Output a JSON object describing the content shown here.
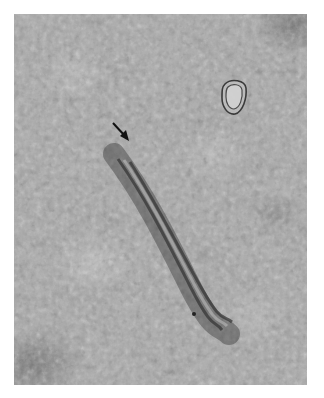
{
  "image": {
    "type": "transmission electron micrograph",
    "description": "Grayscale electron micrograph with a granular background, an elongated double-lined fibrous structure running diagonally from upper-left to lower-right, a small membrane-bound vesicle in the upper right, and a black arrow pointing to the upper end of the elongated structure.",
    "colors": {
      "background_frame": "#ffffff",
      "mid_gray": "#a9a9a9",
      "dark_region": "#5a5a5a",
      "arrow": "#111111"
    },
    "annotations": [
      {
        "kind": "arrow",
        "points_to": "upper end of elongated structure"
      }
    ]
  }
}
